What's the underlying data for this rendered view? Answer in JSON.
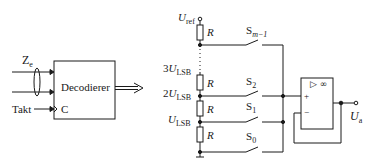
{
  "decoder": {
    "title": "Decodierer",
    "input_label": "Z",
    "input_sub": "e",
    "clock_label": "Takt",
    "clock_pin": "C"
  },
  "ladder": {
    "ref_label": "U",
    "ref_sub": "ref",
    "resistor_label": "R",
    "taps": [
      {
        "prefix": "3",
        "label": "U",
        "sub": "LSB"
      },
      {
        "prefix": "2",
        "label": "U",
        "sub": "LSB"
      },
      {
        "prefix": "",
        "label": "U",
        "sub": "LSB"
      }
    ]
  },
  "switches": [
    {
      "label": "S",
      "sub": "m−1"
    },
    {
      "label": "S",
      "sub": "2"
    },
    {
      "label": "S",
      "sub": "1"
    },
    {
      "label": "S",
      "sub": "0"
    }
  ],
  "opamp": {
    "symbol": "▷ ∞",
    "plus": "+",
    "minus": "−",
    "output_label": "U",
    "output_sub": "a"
  }
}
